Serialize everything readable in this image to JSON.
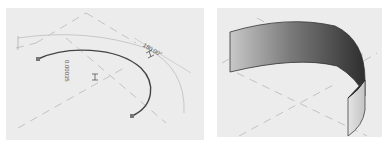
{
  "viewports": {
    "left": {
      "name": "sketch-view",
      "dimensions": {
        "radius": "0.00035",
        "angle": "180.00°"
      }
    },
    "right": {
      "name": "3d-view"
    }
  },
  "colors": {
    "background": "#ececec",
    "grid_dash": "#b8b8b8",
    "arc": "#444444",
    "dim_line": "#c8c8c8",
    "surface_dark": "#3a3a3a",
    "surface_light": "#d0d0d0"
  }
}
